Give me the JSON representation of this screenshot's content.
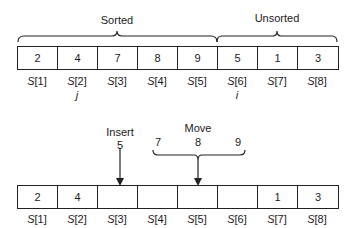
{
  "top": {
    "sorted_label": "Sorted",
    "unsorted_label": "Unsorted",
    "cells": [
      "2",
      "4",
      "7",
      "8",
      "9",
      "5",
      "1",
      "3"
    ],
    "indices": [
      "[1]",
      "[2]",
      "[3]",
      "[4]",
      "[5]",
      "[6]",
      "[7]",
      "[8]"
    ],
    "index_var": "S",
    "pointer_j": "j",
    "pointer_i": "i"
  },
  "bottom": {
    "insert_label": "Insert",
    "insert_value": "5",
    "move_label": "Move",
    "move_values": [
      "7",
      "8",
      "9"
    ],
    "cells": [
      "2",
      "4",
      "",
      "",
      "",
      "",
      "1",
      "3"
    ],
    "indices": [
      "[1]",
      "[2]",
      "[3]",
      "[4]",
      "[5]",
      "[6]",
      "[7]",
      "[8]"
    ],
    "index_var": "S"
  }
}
